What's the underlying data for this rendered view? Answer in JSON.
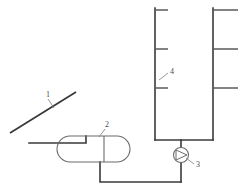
{
  "diagram": {
    "type": "process-flow-schematic",
    "background_color": "#ffffff",
    "line_color": "#3a3a3a",
    "vessel_color": "#6b6b6b",
    "callouts": [
      {
        "id": "1",
        "label": "1",
        "component": "solar-collector",
        "text_x": 46,
        "text_y": 97,
        "leader": "M 48 99 L 54 108"
      },
      {
        "id": "2",
        "label": "2",
        "component": "storage-tank",
        "text_x": 105,
        "text_y": 127,
        "leader": "M 105 129 L 99 137"
      },
      {
        "id": "3",
        "label": "3",
        "component": "circulation-pump",
        "text_x": 196,
        "text_y": 167,
        "leader": "M 194 164 L 186 158"
      },
      {
        "id": "4",
        "label": "4",
        "component": "radiator",
        "text_x": 170,
        "text_y": 74,
        "leader": "M 168 73 L 159 80"
      }
    ],
    "components": {
      "collector": {
        "name": "solar-collector",
        "path": "M 10 133 L 76 92"
      },
      "tank": {
        "name": "storage-tank",
        "body": "M 70 136 L 117 136 A 13 13 0 0 1 117 162 L 70 162 A 13 13 0 0 1 70 136 Z",
        "end_cap": "M 104 136 L 104 162"
      },
      "pump": {
        "name": "circulation-pump",
        "center_x": 181,
        "center_y": 155,
        "radius": 7.5,
        "impeller": "M 176 150 L 187 155 L 176 160 Z"
      },
      "radiator": {
        "name": "radiator",
        "left_riser": "M 155 8 L 155 140",
        "right_riser": "M 213 8 L 213 140",
        "bottom_header": "M 155 140 L 213 140",
        "left_fins": [
          "M 155 10 L 168 10",
          "M 155 49 L 168 49",
          "M 155 88 L 168 88"
        ],
        "right_fins": [
          "M 213 10 L 238 10",
          "M 213 49 L 238 49",
          "M 213 88 L 238 88"
        ]
      },
      "piping": {
        "name": "circuit-piping",
        "collector_to_tank": "M 29 143 L 86 143 L 86 136",
        "tank_to_return": "M 100 162 L 100 182 L 181 182",
        "pump_to_radiator": "M 181 182 L 181 163",
        "pump_riser": "M 181 147 L 181 140"
      }
    }
  }
}
